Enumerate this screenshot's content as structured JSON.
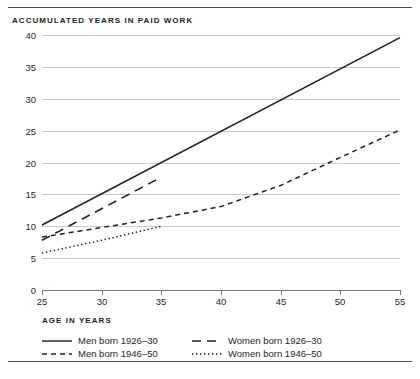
{
  "chart_data": {
    "type": "line",
    "title": "",
    "ylabel": "ACCUMULATED YEARS IN PAID WORK",
    "xlabel": "AGE IN YEARS",
    "xlim": [
      25,
      55
    ],
    "ylim": [
      0,
      40
    ],
    "xticks": [
      25,
      30,
      35,
      40,
      45,
      50,
      55
    ],
    "yticks": [
      0,
      5,
      10,
      15,
      20,
      25,
      30,
      35,
      40
    ],
    "grid": "horizontal",
    "legend_position": "bottom",
    "series": [
      {
        "name": "Men born 1926–30",
        "style": "solid",
        "x": [
          25,
          55
        ],
        "values": [
          10.2,
          39.6
        ]
      },
      {
        "name": "Women born 1926–30",
        "style": "long-dash",
        "x": [
          25,
          35
        ],
        "values": [
          7.8,
          17.7
        ]
      },
      {
        "name": "Men born 1946–50",
        "style": "dash",
        "x": [
          25,
          30,
          35,
          40,
          45,
          50,
          55
        ],
        "values": [
          8.3,
          9.8,
          11.3,
          13.1,
          16.4,
          20.8,
          25.1
        ]
      },
      {
        "name": "Women born 1946–50",
        "style": "dot",
        "x": [
          25,
          30,
          35
        ],
        "values": [
          5.8,
          7.8,
          10.0
        ]
      }
    ]
  },
  "axes": {
    "y_title": "ACCUMULATED YEARS IN PAID WORK",
    "x_title": "AGE IN YEARS",
    "y_tick_labels": [
      "40",
      "35",
      "30",
      "25",
      "20",
      "15",
      "10",
      "5",
      "0"
    ],
    "x_tick_labels": [
      "25",
      "30",
      "35",
      "40",
      "45",
      "50",
      "55"
    ]
  },
  "legend": {
    "items": [
      {
        "label": "Men born 1926–30",
        "style": "solid"
      },
      {
        "label": "Women born 1926–30",
        "style": "long-dash"
      },
      {
        "label": "Men born 1946–50",
        "style": "dash"
      },
      {
        "label": "Women born 1946–50",
        "style": "dot"
      }
    ]
  },
  "colors": {
    "ink": "#231f20",
    "grid": "#c9c9c9",
    "axis": "#7a7a7a",
    "rule": "#4d4d4d"
  }
}
